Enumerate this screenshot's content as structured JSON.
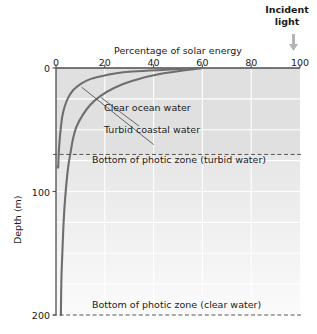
{
  "annotations": {
    "incident_light_line1": "Incident",
    "incident_light_line2": "light",
    "arrow_icon": "down-arrow-icon"
  },
  "chart_data": {
    "type": "line",
    "title": "",
    "xlabel": "Percentage of solar energy",
    "ylabel": "Depth (m)",
    "xlim": [
      0,
      100
    ],
    "ylim": [
      200,
      0
    ],
    "x_axis_position": "top",
    "y_axis_inverted": true,
    "grid": true,
    "legend": "inline-annotations",
    "xticks": [
      0,
      20,
      40,
      60,
      80,
      100
    ],
    "xtick_labels": [
      "0",
      "20",
      "40",
      "60",
      "80",
      "100"
    ],
    "yticks": [
      0,
      100,
      200
    ],
    "ytick_labels": [
      "0",
      "100",
      "200"
    ],
    "series": [
      {
        "name": "Clear ocean water",
        "label": "Clear ocean water",
        "color": "#6e6e6e",
        "points": [
          {
            "percent": 60,
            "depth": 0
          },
          {
            "percent": 42,
            "depth": 5
          },
          {
            "percent": 32,
            "depth": 10
          },
          {
            "percent": 24,
            "depth": 16
          },
          {
            "percent": 18,
            "depth": 23
          },
          {
            "percent": 14,
            "depth": 30
          },
          {
            "percent": 11,
            "depth": 38
          },
          {
            "percent": 8.5,
            "depth": 47
          },
          {
            "percent": 7,
            "depth": 57
          },
          {
            "percent": 6,
            "depth": 68
          },
          {
            "percent": 5,
            "depth": 80
          },
          {
            "percent": 4.2,
            "depth": 95
          },
          {
            "percent": 3.5,
            "depth": 112
          },
          {
            "percent": 3,
            "depth": 130
          },
          {
            "percent": 2.6,
            "depth": 150
          },
          {
            "percent": 2.2,
            "depth": 172
          },
          {
            "percent": 2,
            "depth": 200
          }
        ]
      },
      {
        "name": "Turbid coastal water",
        "label": "Turbid coastal water",
        "color": "#6e6e6e",
        "points": [
          {
            "percent": 60,
            "depth": 0
          },
          {
            "percent": 30,
            "depth": 3
          },
          {
            "percent": 20,
            "depth": 6
          },
          {
            "percent": 14,
            "depth": 9
          },
          {
            "percent": 10,
            "depth": 13
          },
          {
            "percent": 7,
            "depth": 18
          },
          {
            "percent": 5,
            "depth": 24
          },
          {
            "percent": 3.6,
            "depth": 31
          },
          {
            "percent": 2.6,
            "depth": 39
          },
          {
            "percent": 2,
            "depth": 48
          },
          {
            "percent": 1.5,
            "depth": 58
          },
          {
            "percent": 1.1,
            "depth": 70
          },
          {
            "percent": 0.9,
            "depth": 80
          },
          {
            "percent": 0.7,
            "depth": 80
          }
        ]
      }
    ],
    "reference_lines": [
      {
        "name": "photic-zone-turbid",
        "label": "Bottom of photic zone (turbid water)",
        "depth": 70,
        "style": "dashed"
      },
      {
        "name": "photic-zone-clear",
        "label": "Bottom of photic zone (clear water)",
        "depth": 200,
        "style": "dashed"
      }
    ],
    "zones": [
      {
        "name": "photic-zone-shaded",
        "from_depth": 0,
        "to_depth": 70,
        "fill": "#e0e0e0"
      },
      {
        "name": "aphotic-gradient",
        "from_depth": 70,
        "to_depth": 200,
        "fill": "#ececec"
      }
    ],
    "colors": {
      "curve": "#6e6e6e",
      "plot_background_upper": "#e0e0e0",
      "plot_background_lower": "#ededed",
      "gridline": "#ffffff",
      "axis": "#4d4d4d",
      "dashed_line": "#555555",
      "arrow": "#b0b0b0",
      "text": "#1a1a1a"
    }
  }
}
